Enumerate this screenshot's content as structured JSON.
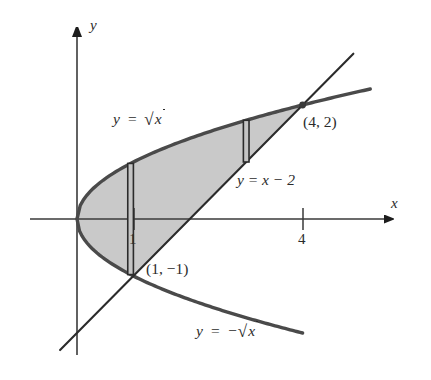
{
  "figure": {
    "background_color": "#ffffff",
    "shade_color": "#c9c9c9",
    "curve_color": "#4a4a4a",
    "line_color": "#2b2b2b",
    "axis_color": "#3a3a3a",
    "text_color": "#2b2b2b"
  },
  "axes": {
    "x_label": "x",
    "y_label": "y",
    "x_ticks": [
      {
        "value": "1",
        "label": "1"
      },
      {
        "value": "4",
        "label": "4"
      }
    ],
    "y_ticks": [],
    "x_range": [
      -0.4,
      5.8
    ],
    "y_range": [
      -2.9,
      3.2
    ],
    "grid": false,
    "arrowheads": [
      "x-positive",
      "y-positive"
    ]
  },
  "labels": {
    "upper_curve": {
      "lhs": "y",
      "eq": "=",
      "radicand": "x",
      "sign": "",
      "text": "y = √x"
    },
    "lower_curve": {
      "lhs": "y",
      "eq": "=",
      "radicand": "x",
      "sign": "−",
      "text": "y = −√x"
    },
    "line": {
      "text": "y = x − 2"
    },
    "point_upper": {
      "text": "(4, 2)"
    },
    "point_lower": {
      "text": "(1, −1)"
    }
  },
  "chart_data": {
    "type": "line",
    "title": "",
    "xlabel": "x",
    "ylabel": "y",
    "xlim": [
      -0.4,
      5.8
    ],
    "ylim": [
      -2.9,
      3.2
    ],
    "grid": false,
    "legend": "none",
    "series": [
      {
        "name": "y = √x",
        "equation": "y = sqrt(x)",
        "color": "#4a4a4a",
        "x": [
          0,
          0.25,
          0.5,
          1,
          1.5,
          2,
          2.5,
          3,
          3.5,
          4,
          4.5,
          5,
          5.2
        ],
        "values": [
          0,
          0.5,
          0.707,
          1,
          1.225,
          1.414,
          1.581,
          1.732,
          1.871,
          2,
          2.121,
          2.236,
          2.28
        ]
      },
      {
        "name": "y = −√x",
        "equation": "y = -sqrt(x)",
        "color": "#4a4a4a",
        "x": [
          0,
          0.25,
          0.5,
          1,
          1.5,
          2,
          2.5,
          3,
          3.5,
          4
        ],
        "values": [
          0,
          -0.5,
          -0.707,
          -1,
          -1.225,
          -1.414,
          -1.581,
          -1.732,
          -1.871,
          -2
        ]
      },
      {
        "name": "y = x − 2",
        "equation": "y = x - 2",
        "color": "#2b2b2b",
        "x": [
          -0.3,
          1,
          4,
          4.9
        ],
        "values": [
          -2.3,
          -1,
          2,
          2.9
        ]
      }
    ],
    "shaded_region": {
      "description": "Region bounded above by y = √x, below by y = −√x for 0 ≤ x ≤ 1 and by y = x − 2 for 1 ≤ x ≤ 4",
      "color": "#c9c9c9",
      "x_from": 0,
      "x_to": 4
    },
    "annotations": [
      {
        "label": "(4, 2)",
        "x": 4,
        "y": 2,
        "marker": "dot"
      },
      {
        "label": "(1, −1)",
        "x": 1,
        "y": -1,
        "marker": "none"
      }
    ],
    "rectangles": [
      {
        "name": "left-strip",
        "x": 0.95,
        "y_top": 0.975,
        "y_bottom": -0.975,
        "width": 0.1
      },
      {
        "name": "right-strip",
        "x": 3.0,
        "y_top": 1.732,
        "y_bottom": 1.0,
        "width": 0.1
      }
    ]
  }
}
